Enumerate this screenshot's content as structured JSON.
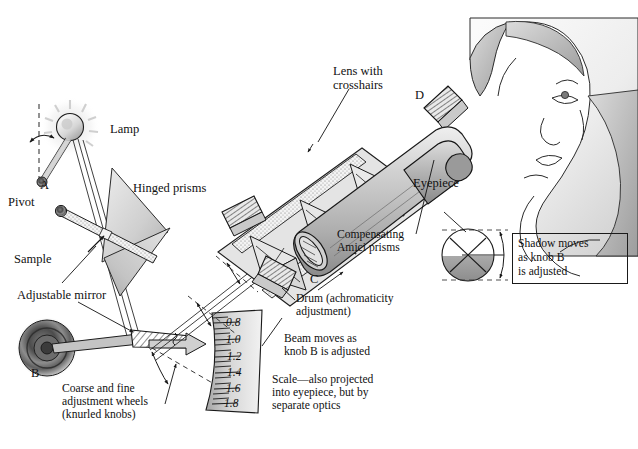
{
  "figure": {
    "domain_title": "Abbe refractometer schematic",
    "background": "#ffffff",
    "ink": "#111111"
  },
  "labels": {
    "lamp": "Lamp",
    "pivot": "Pivot",
    "point_a": "A",
    "point_b": "B",
    "point_c": "C",
    "point_d": "D",
    "hinged_prisms": "Hinged prisms",
    "sample": "Sample",
    "adjustable_mirror": "Adjustable mirror",
    "coarse_fine": "Coarse and fine\nadjustment wheels\n(knurled knobs)",
    "lens_with_crosshairs": "Lens with\ncrosshairs",
    "eyepiece": "Eyepiece",
    "compensating_amici": "Compensating\nAmici prisms",
    "drum": "Drum (achromaticity\nadjustment)",
    "beam_moves": "Beam moves as\nknob B is adjusted",
    "scale_note": "Scale—also projected\ninto eyepiece, but by\nseparate optics",
    "shadow_box": "Shadow moves\nas knob B\nis adjusted"
  },
  "scale": {
    "title": "refractive index scale",
    "ticks": [
      "0.8",
      "1.0",
      "1.2",
      "1.4",
      "1.6",
      "1.8"
    ],
    "minor_ticks_between": 2
  },
  "colors": {
    "prism_fill_light": "#d9d9d9",
    "prism_fill_mid": "#c2c2c2",
    "tube_light": "#d2d2d2",
    "tube_mid": "#b4b4b4",
    "tube_dark": "#8f8f8f",
    "knob_dark": "#5a5a5a",
    "stipple": "#e8e8e8",
    "skin_light": "#f0f0f0",
    "hair_shade": "#c9c9c9",
    "outline": "#1a1a1a"
  }
}
